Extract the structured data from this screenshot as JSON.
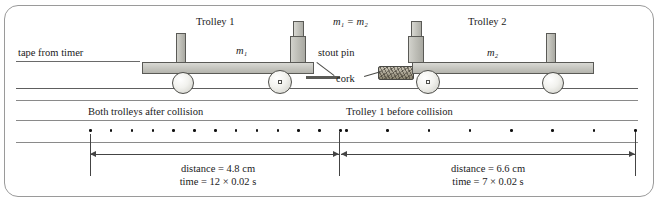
{
  "figure": {
    "caption_labels": {
      "tape_from_timer": "tape from timer",
      "trolley1": "Trolley 1",
      "trolley2": "Trolley 2",
      "mass1": "m₁",
      "mass2": "m₂",
      "mass_equality": "m₁ = m₂",
      "stout_pin": "stout pin",
      "cork": "cork"
    },
    "tape_sections": [
      {
        "name": "after-collision",
        "label": "Both trolleys after collision",
        "distance": "distance = 4.8 cm",
        "time": "time = 12 × 0.02 s",
        "dot_count": 13,
        "interval_count": 12
      },
      {
        "name": "before-collision",
        "label": "Trolley 1 before collision",
        "distance": "distance = 6.6 cm",
        "time": "time = 7 × 0.02 s",
        "dot_count": 8,
        "interval_count": 7
      }
    ],
    "colors": {
      "ink": "#1a1a1a",
      "rule": "#5e5e5e",
      "frame": "#9a9a9a",
      "metal_light": "#d9d9d4",
      "metal_dark": "#a9a9a2",
      "dot": "#111111",
      "arrow": "#444444"
    }
  }
}
